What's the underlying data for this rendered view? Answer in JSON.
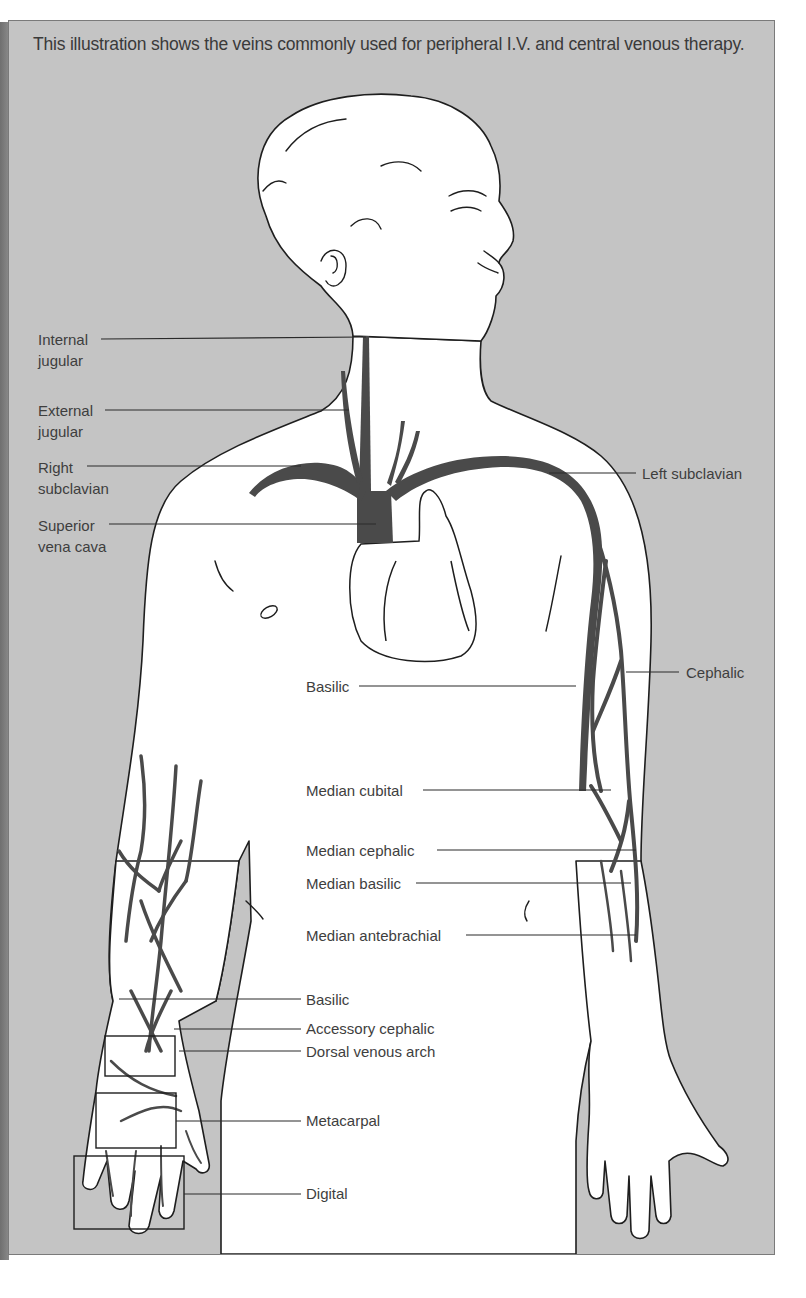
{
  "caption": "This illustration shows the veins commonly used for peripheral I.V. and central venous therapy.",
  "colors": {
    "background_panel": "#c4c4c4",
    "body_fill": "#ffffff",
    "vein": "#4a4a4a",
    "outline": "#1e1e1e",
    "label_text": "#3e3e3e"
  },
  "labels": {
    "internal_jugular": [
      "Internal",
      "jugular"
    ],
    "external_jugular": [
      "External",
      "jugular"
    ],
    "right_subclavian": [
      "Right",
      "subclavian"
    ],
    "superior_vena_cava": [
      "Superior",
      "vena cava"
    ],
    "left_subclavian": "Left subclavian",
    "cephalic": "Cephalic",
    "basilic_upper": "Basilic",
    "median_cubital": "Median cubital",
    "median_cephalic": "Median cephalic",
    "median_basilic": "Median basilic",
    "median_antebrachial": "Median antebrachial",
    "basilic_lower": "Basilic",
    "accessory_cephalic": "Accessory cephalic",
    "dorsal_venous_arch": "Dorsal venous arch",
    "metacarpal": "Metacarpal",
    "digital": "Digital"
  }
}
